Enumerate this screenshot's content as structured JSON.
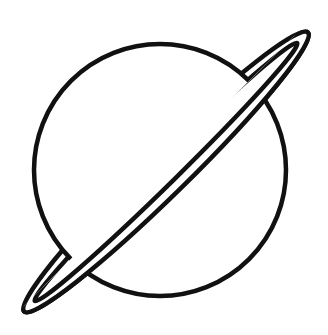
{
  "image": {
    "subject": "planet-with-ring-line-drawing",
    "background_color": "#ffffff",
    "stroke_color": "#111111"
  }
}
